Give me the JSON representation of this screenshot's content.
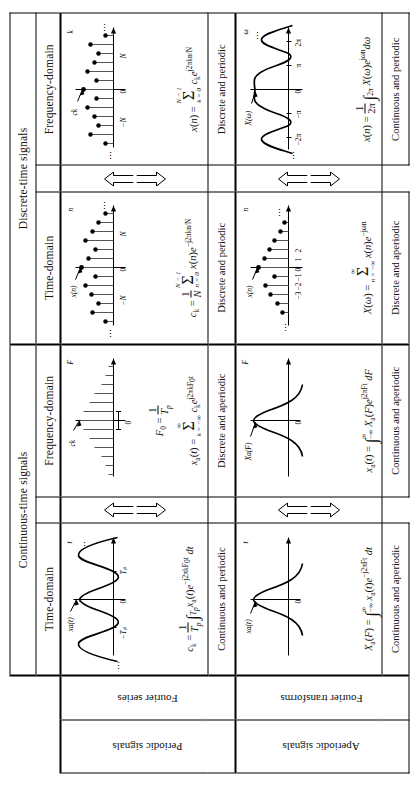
{
  "figure": {
    "column_groups": [
      {
        "label": "Continuous-time signals",
        "columns": [
          "Time-domain",
          "Frequency-domain"
        ]
      },
      {
        "label": "Discrete-time signals",
        "columns": [
          "Time-domain",
          "Frequency-domain"
        ]
      }
    ],
    "row_groups": [
      {
        "signals": "Periodic signals",
        "analysis": "Fourier series"
      },
      {
        "signals": "Aperiodic signals",
        "analysis": "Fourier transforms"
      }
    ],
    "cells": {
      "ct_periodic_time": {
        "signal_label": "xₐ(t)",
        "axis_label": "t",
        "ticks": [
          "−Tₚ",
          "0",
          "Tₚ"
        ],
        "ellipsis": "⋯",
        "formula_text": "cₖ = (1/Tₚ) ∫_{Tₚ} xₐ(t)e^{−j2πkF₀t} dt",
        "character": "Continuous and periodic"
      },
      "ct_periodic_freq": {
        "signal_label": "cₖ",
        "axis_label": "F",
        "ticks": [
          "0"
        ],
        "spacing_label": "F₀ = 1/Tₚ",
        "formula_text": "xₐ(t) = Σ_{k=−∞}^{∞} cₖe^{j2πkF₀t}",
        "character": "Discrete and aperiodic"
      },
      "dt_periodic_time": {
        "signal_label": "x(n)",
        "axis_label": "n",
        "ticks": [
          "−N",
          "0",
          "N"
        ],
        "ellipsis": "⋯",
        "formula_text": "cₖ = (1/N) Σ_{n=0}^{N−1} x(n)e^{−j2πkn/N}",
        "character": "Discrete and periodic"
      },
      "dt_periodic_freq": {
        "signal_label": "cₖ",
        "axis_label": "k",
        "ticks": [
          "−N",
          "0",
          "N"
        ],
        "ellipsis": "⋯",
        "formula_text": "x(n) = Σ_{k=0}^{N−1} cₖe^{j2πkn/N}",
        "character": "Discrete and periodic"
      },
      "ct_aperiodic_time": {
        "signal_label": "xₐ(t)",
        "axis_label": "t",
        "ticks": [
          "0"
        ],
        "formula_text": "Xₐ(F) = ∫_{−∞}^{∞} xₐ(t)e^{−j2πFt} dt",
        "character": "Continuous and aperiodic"
      },
      "ct_aperiodic_freq": {
        "signal_label": "Xₐ(F)",
        "axis_label": "F",
        "ticks": [
          "0"
        ],
        "formula_text": "xₐ(t) = ∫_{−∞}^{∞} Xₐ(F)e^{j2πFt} dF",
        "character": "Continuous and aperiodic"
      },
      "dt_aperiodic_time": {
        "signal_label": "x(n)",
        "axis_label": "n",
        "ticks": [
          "−3",
          "−2",
          "−1",
          "0",
          "1",
          "2"
        ],
        "ellipsis": "⋯",
        "formula_text": "X(ω) = Σ_{n=−∞}^{∞} x(n)e^{−jωn}",
        "character": "Discrete and aperiodic"
      },
      "dt_aperiodic_freq": {
        "signal_label": "X(ω)",
        "axis_label": "ω",
        "ticks": [
          "−2π",
          "−π",
          "0",
          "π",
          "2π"
        ],
        "ellipsis": "⋯",
        "formula_text": "x(n) = (1/2π) ∫_{2π} X(ω)e^{jωn} dω",
        "character": "Continuous and periodic"
      }
    },
    "tick_labels": {
      "zero": "0",
      "neg_Tp": "−Tₚ",
      "Tp": "Tₚ",
      "neg_N": "−N",
      "N": "N",
      "neg_2pi": "−2π",
      "neg_pi": "−π",
      "pi": "π",
      "two_pi": "2π",
      "n_axis": "n",
      "k_axis": "k",
      "t_axis": "t",
      "F_axis": "F",
      "w_axis": "ω",
      "m3": "−3",
      "m2": "−2",
      "m1": "−1",
      "p1": "1",
      "p2": "2",
      "ellipsis": "⋯",
      "vdots": "⋮"
    },
    "colors": {
      "ink": "#000000",
      "stem": "#555555",
      "paper": "#ffffff"
    }
  }
}
